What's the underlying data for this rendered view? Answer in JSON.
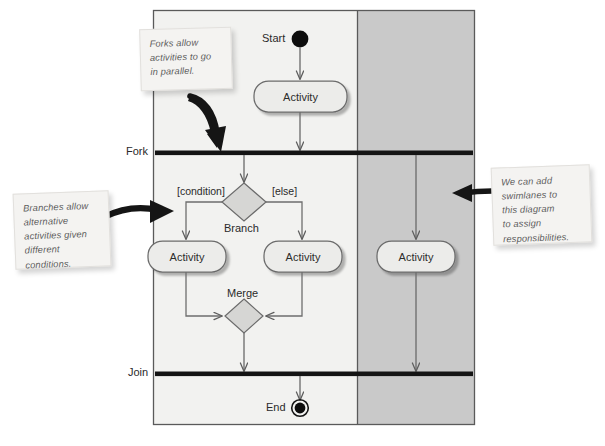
{
  "diagram": {
    "frame": {
      "x": 153,
      "y": 10,
      "width": 322,
      "height": 415
    },
    "swimlanes": [
      {
        "name": "left-lane",
        "label": "",
        "fill": "#f2f2f0",
        "x": 153,
        "width": 204
      },
      {
        "name": "right-lane",
        "label": "",
        "fill": "#c9c9c9",
        "x": 357,
        "width": 118
      }
    ],
    "side_labels": [
      {
        "name": "fork",
        "text": "Fork",
        "x": 126,
        "y": 145
      },
      {
        "name": "join",
        "text": "Join",
        "x": 128,
        "y": 366
      }
    ],
    "nodes": {
      "start": {
        "label": "Start",
        "shape": "filled-circle"
      },
      "end": {
        "label": "End",
        "shape": "circle-in-ring"
      },
      "branch": {
        "label": "Branch",
        "shape": "diamond"
      },
      "merge": {
        "label": "Merge",
        "shape": "diamond"
      }
    },
    "guards": [
      {
        "name": "condition-guard",
        "text": "[condition]"
      },
      {
        "name": "else-guard",
        "text": "[else]"
      }
    ],
    "activities": [
      {
        "name": "activity-top",
        "text": "Activity",
        "lane": "left"
      },
      {
        "name": "activity-left",
        "text": "Activity",
        "lane": "left"
      },
      {
        "name": "activity-right",
        "text": "Activity",
        "lane": "left"
      },
      {
        "name": "activity-lane2",
        "text": "Activity",
        "lane": "right"
      }
    ],
    "notes": [
      {
        "name": "note-forks",
        "lines": [
          "Forks allow",
          "activities to go",
          "in parallel."
        ],
        "x": 140,
        "y": 28,
        "width": 92,
        "height": 62
      },
      {
        "name": "note-branches",
        "lines": [
          "Branches allow",
          "alternative",
          "activities given",
          "different",
          "conditions."
        ],
        "x": 14,
        "y": 192,
        "width": 96,
        "height": 75
      },
      {
        "name": "note-swimlanes",
        "lines": [
          "We can add",
          "swimlanes to",
          "this diagram",
          "to assign",
          "responsibilities."
        ],
        "x": 492,
        "y": 166,
        "width": 99,
        "height": 78
      }
    ],
    "colors": {
      "lane_left_fill": "#f2f2f0",
      "lane_right_fill": "#c9c9c9",
      "frame_stroke": "#5a5a5a",
      "bar_fill": "#141414",
      "flow_stroke": "#6e6e6e",
      "activity_fill": "#ececea",
      "activity_stroke": "#6b6b6b",
      "diamond_fill": "#d6d6d4",
      "note_fill": "#f4f3f1",
      "pointer_fill": "#1a1a1a"
    }
  }
}
